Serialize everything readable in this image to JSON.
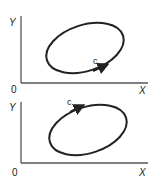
{
  "diagrams": [
    {
      "id": "top",
      "y_label": "Y",
      "x_label": "X",
      "origin_label": "0",
      "curve_label": "c",
      "direction": "counterclockwise"
    },
    {
      "id": "bottom",
      "y_label": "Y",
      "x_label": "X",
      "origin_label": "0",
      "curve_label": "c",
      "direction": "clockwise"
    }
  ],
  "colors": {
    "ink": "#222222",
    "axis": "#555555",
    "background": "#ffffff"
  }
}
